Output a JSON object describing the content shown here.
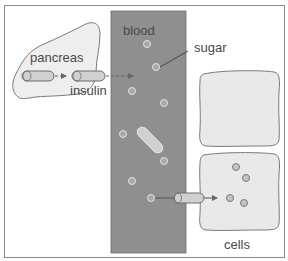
{
  "diagram": {
    "title": "",
    "labels": {
      "pancreas": "pancreas",
      "insulin": "insulin",
      "blood": "blood",
      "sugar": "sugar",
      "cells": "cells"
    },
    "colors": {
      "blood_fill": "#8f8f8f",
      "pancreas_fill": "#eeeeee",
      "cell_fill": "#e9e9e9",
      "outline": "#7a7a7a",
      "insulin_fill": "#d0d0d0",
      "sugar_fill": "#a8a8a8",
      "text": "#4a4a4a",
      "frame": "#8a8a8a"
    },
    "nodes": [
      {
        "id": "pancreas",
        "label": "pancreas",
        "shape": "blob"
      },
      {
        "id": "blood",
        "label": "blood",
        "shape": "vertical-strip"
      },
      {
        "id": "cell-top",
        "label": "",
        "shape": "rounded-square"
      },
      {
        "id": "cell-bottom",
        "label": "cells",
        "shape": "rounded-square"
      }
    ],
    "edges": [
      {
        "from": "pancreas",
        "to": "blood",
        "label": "insulin",
        "style": "dashed-arrow"
      },
      {
        "from": "blood",
        "to": "cell-bottom",
        "label": "",
        "style": "solid-arrow"
      }
    ],
    "annotations": [
      {
        "text": "sugar",
        "points_to": "sugar-molecule-in-blood"
      }
    ]
  }
}
